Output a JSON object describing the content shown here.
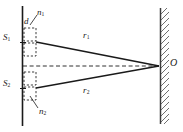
{
  "figure": {
    "type": "optics-ray-diagram",
    "colors": {
      "ink": "#1a1a1a",
      "hatch": "#4a4a4a",
      "background": "#ffffff"
    },
    "labels": {
      "n1": {
        "base": "n",
        "sub": "1",
        "x": 38,
        "y": 13
      },
      "n2": {
        "base": "n",
        "sub": "2",
        "x": 40,
        "y": 112
      },
      "d": {
        "base": "d",
        "sub": "",
        "x": 25,
        "y": 22
      },
      "s1": {
        "base": "S",
        "sub": "1",
        "x": 3,
        "y": 37
      },
      "s2": {
        "base": "S",
        "sub": "2",
        "x": 3,
        "y": 77
      },
      "r1": {
        "base": "r",
        "sub": "1",
        "x": 84,
        "y": 36
      },
      "r2": {
        "base": "r",
        "sub": "2",
        "x": 84,
        "y": 92
      },
      "o": {
        "base": "O",
        "sub": "",
        "x": 170,
        "y": 62
      }
    },
    "geometry": {
      "barrier": {
        "x": 22,
        "y_top": 6,
        "y_bottom": 126
      },
      "screen": {
        "x": 160,
        "y_top": 8,
        "y_bottom": 124,
        "hatch_direction": "up-right"
      },
      "point_o": {
        "x": 160,
        "y": 66
      },
      "source_s1": {
        "x": 24,
        "y": 42
      },
      "source_s2": {
        "x": 24,
        "y": 88
      },
      "axis": {
        "x1": 22,
        "y1": 66,
        "x2": 160,
        "y2": 66,
        "style": "dashed"
      },
      "film_boxes": [
        {
          "x": 24,
          "y": 28,
          "w": 12,
          "h": 13
        },
        {
          "x": 24,
          "y": 43,
          "w": 12,
          "h": 13
        },
        {
          "x": 24,
          "y": 72,
          "w": 12,
          "h": 13
        },
        {
          "x": 24,
          "y": 87,
          "w": 12,
          "h": 13
        }
      ],
      "leader_d": {
        "x1": 30,
        "y1": 24,
        "x2": 36,
        "y2": 16
      },
      "leader_n2": {
        "x1": 38,
        "y1": 108,
        "x2": 30,
        "y2": 96
      }
    }
  }
}
